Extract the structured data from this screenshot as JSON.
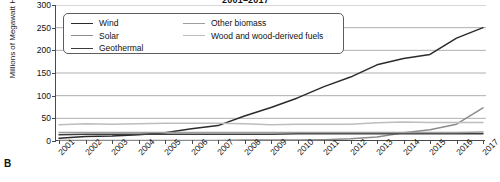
{
  "figure": {
    "panel_letter": "B"
  },
  "chart_data": {
    "type": "line",
    "title": "2001–2017",
    "xlabel": "",
    "ylabel": "Millions of Megawatt Hours",
    "x": [
      2001,
      2002,
      2003,
      2004,
      2005,
      2006,
      2007,
      2008,
      2009,
      2010,
      2011,
      2012,
      2013,
      2014,
      2015,
      2016,
      2017
    ],
    "categories": [
      "2001",
      "2002",
      "2003",
      "2004",
      "2005",
      "2006",
      "2007",
      "2008",
      "2009",
      "2010",
      "2011",
      "2012",
      "2013",
      "2014",
      "2015",
      "2016",
      "2017"
    ],
    "ylim": [
      0,
      300
    ],
    "yticks": [
      0,
      50,
      100,
      150,
      200,
      250,
      300
    ],
    "grid": true,
    "legend_position": "upper-left",
    "series": [
      {
        "name": "Wind",
        "color": "#2b2b2b",
        "values": [
          6,
          10,
          11,
          14,
          18,
          27,
          34,
          55,
          74,
          95,
          120,
          141,
          168,
          182,
          191,
          227,
          250
        ]
      },
      {
        "name": "Solar",
        "color": "#8c8c8c",
        "values": [
          1,
          1,
          1,
          1,
          1,
          1,
          1,
          2,
          2,
          2,
          3,
          5,
          9,
          18,
          25,
          37,
          73
        ]
      },
      {
        "name": "Geothermal",
        "color": "#3d3d3d",
        "values": [
          14,
          15,
          15,
          15,
          15,
          15,
          15,
          15,
          15,
          16,
          16,
          16,
          16,
          16,
          16,
          16,
          16
        ]
      },
      {
        "name": "Other biomass",
        "color": "#9e9e9e",
        "values": [
          19,
          19,
          19,
          19,
          19,
          19,
          19,
          19,
          19,
          19,
          19,
          19,
          19,
          19,
          19,
          19,
          20
        ]
      },
      {
        "name": "Wood and wood-derived fuels",
        "color": "#bdbdbd",
        "values": [
          36,
          38,
          37,
          38,
          39,
          39,
          39,
          38,
          36,
          37,
          37,
          37,
          40,
          42,
          41,
          41,
          41
        ]
      }
    ]
  }
}
